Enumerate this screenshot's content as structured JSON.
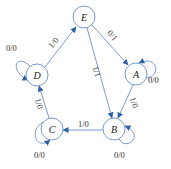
{
  "diagram": {
    "type": "state-machine",
    "colors": {
      "stroke": "#6a8fc7",
      "arrow": "#2e5fa8",
      "text": "#222222"
    },
    "nodes": [
      {
        "id": "E",
        "label": "E"
      },
      {
        "id": "A",
        "label": "A"
      },
      {
        "id": "B",
        "label": "B"
      },
      {
        "id": "C",
        "label": "C"
      },
      {
        "id": "D",
        "label": "D"
      }
    ],
    "edges": [
      {
        "from": "D",
        "to": "E",
        "label": "1/0"
      },
      {
        "from": "E",
        "to": "A",
        "label": "0/1"
      },
      {
        "from": "E",
        "to": "B",
        "label": "1/1"
      },
      {
        "from": "A",
        "to": "B",
        "label": "1/0"
      },
      {
        "from": "B",
        "to": "C",
        "label": "1/0"
      },
      {
        "from": "C",
        "to": "D",
        "label": "1/0"
      },
      {
        "from": "D",
        "to": "D",
        "label": "0/0"
      },
      {
        "from": "A",
        "to": "A",
        "label": "0/0"
      },
      {
        "from": "B",
        "to": "B",
        "label": "0/0"
      },
      {
        "from": "C",
        "to": "C",
        "label": "0/0"
      }
    ]
  }
}
